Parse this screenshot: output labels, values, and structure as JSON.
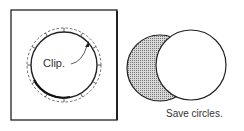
{
  "figure_left": {
    "label": "Clip.",
    "description": "circle inside square with dashed cut line and tick marks"
  },
  "figure_right": {
    "caption": "Save circles.",
    "description": "shaded crescent circle behind white circle"
  },
  "colors": {
    "stroke": "#222222",
    "shade": "#9a9a9a",
    "background": "#ffffff"
  }
}
